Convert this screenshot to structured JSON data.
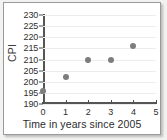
{
  "chart_data": {
    "type": "scatter",
    "title": "",
    "xlabel": "Time in years since 2005",
    "ylabel": "CPI",
    "x": [
      0,
      1,
      2,
      3,
      4
    ],
    "values": [
      196,
      202,
      210,
      210,
      216
    ],
    "points": [
      {
        "x": 0,
        "y": 196
      },
      {
        "x": 1,
        "y": 202
      },
      {
        "x": 2,
        "y": 210
      },
      {
        "x": 3,
        "y": 210
      },
      {
        "x": 4,
        "y": 216
      }
    ],
    "xlim": [
      0,
      5
    ],
    "ylim": [
      190,
      230
    ],
    "xticks": [
      0,
      1,
      2,
      3,
      4,
      5
    ],
    "yticks": [
      190,
      195,
      200,
      205,
      210,
      215,
      220,
      225,
      230
    ],
    "xtick_labels": [
      "0",
      "1",
      "2",
      "3",
      "4",
      "5"
    ],
    "ytick_labels": [
      "190",
      "195",
      "200",
      "205",
      "210",
      "215",
      "220",
      "225",
      "230"
    ],
    "grid": "horizontal",
    "legend": null,
    "marker_color": "#7d7d7d",
    "axis_color": "#555555",
    "grid_color": "#ededed",
    "background_color": "#ffffff"
  }
}
